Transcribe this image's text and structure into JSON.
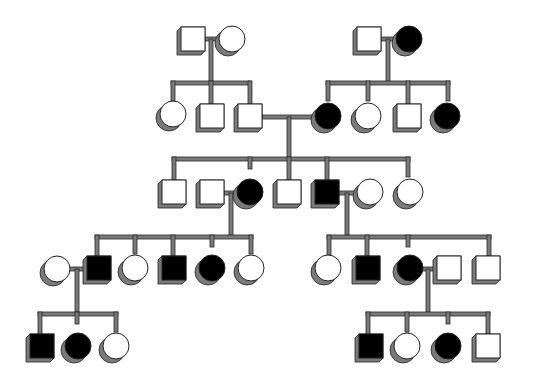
{
  "diagram": {
    "type": "pedigree",
    "legend_note": "Square = male, circle = female, filled = affected",
    "colors": {
      "affected": "#000000",
      "unaffected": "#ffffff",
      "outline": "#222222",
      "shadow": "#7a7a7a",
      "line": "#7a7a7a"
    },
    "generations": [
      {
        "label": "I",
        "individuals": [
          {
            "id": "I-1",
            "sex": "male",
            "affected": false
          },
          {
            "id": "I-2",
            "sex": "female",
            "affected": false
          },
          {
            "id": "I-3",
            "sex": "male",
            "affected": false
          },
          {
            "id": "I-4",
            "sex": "female",
            "affected": true
          }
        ]
      },
      {
        "label": "II",
        "individuals": [
          {
            "id": "II-1",
            "sex": "female",
            "affected": false
          },
          {
            "id": "II-2",
            "sex": "male",
            "affected": false
          },
          {
            "id": "II-3",
            "sex": "male",
            "affected": false
          },
          {
            "id": "II-4",
            "sex": "female",
            "affected": true
          },
          {
            "id": "II-5",
            "sex": "female",
            "affected": false
          },
          {
            "id": "II-6",
            "sex": "male",
            "affected": false
          },
          {
            "id": "II-7",
            "sex": "female",
            "affected": true
          }
        ]
      },
      {
        "label": "III",
        "individuals": [
          {
            "id": "III-1",
            "sex": "male",
            "affected": false
          },
          {
            "id": "III-2",
            "sex": "male",
            "affected": false
          },
          {
            "id": "III-3",
            "sex": "female",
            "affected": true
          },
          {
            "id": "III-4",
            "sex": "male",
            "affected": false
          },
          {
            "id": "III-5",
            "sex": "male",
            "affected": true
          },
          {
            "id": "III-6",
            "sex": "female",
            "affected": false
          },
          {
            "id": "III-7",
            "sex": "female",
            "affected": false
          }
        ]
      },
      {
        "label": "IV",
        "individuals": [
          {
            "id": "IV-1",
            "sex": "female",
            "affected": false
          },
          {
            "id": "IV-2",
            "sex": "male",
            "affected": true
          },
          {
            "id": "IV-3",
            "sex": "female",
            "affected": false
          },
          {
            "id": "IV-4",
            "sex": "male",
            "affected": true
          },
          {
            "id": "IV-5",
            "sex": "female",
            "affected": true
          },
          {
            "id": "IV-6",
            "sex": "female",
            "affected": false
          },
          {
            "id": "IV-7",
            "sex": "female",
            "affected": false
          },
          {
            "id": "IV-8",
            "sex": "male",
            "affected": true
          },
          {
            "id": "IV-9",
            "sex": "female",
            "affected": true
          },
          {
            "id": "IV-10",
            "sex": "male",
            "affected": false
          },
          {
            "id": "IV-11",
            "sex": "male",
            "affected": false
          }
        ]
      },
      {
        "label": "V",
        "individuals": [
          {
            "id": "V-1",
            "sex": "male",
            "affected": true
          },
          {
            "id": "V-2",
            "sex": "female",
            "affected": true
          },
          {
            "id": "V-3",
            "sex": "female",
            "affected": false
          },
          {
            "id": "V-4",
            "sex": "male",
            "affected": true
          },
          {
            "id": "V-5",
            "sex": "female",
            "affected": false
          },
          {
            "id": "V-6",
            "sex": "female",
            "affected": true
          },
          {
            "id": "V-7",
            "sex": "male",
            "affected": false
          }
        ]
      }
    ],
    "matings": [
      {
        "partners": [
          "I-1",
          "I-2"
        ],
        "children": [
          "II-1",
          "II-2",
          "II-3"
        ]
      },
      {
        "partners": [
          "I-3",
          "I-4"
        ],
        "children": [
          "II-4",
          "II-5",
          "II-6",
          "II-7"
        ]
      },
      {
        "partners": [
          "II-3",
          "II-4"
        ],
        "children": [
          "III-1",
          "III-3",
          "III-4",
          "III-5",
          "III-7"
        ]
      },
      {
        "partners": [
          "III-2",
          "III-3"
        ],
        "children": [
          "IV-2",
          "IV-3",
          "IV-4",
          "IV-5",
          "IV-6"
        ]
      },
      {
        "partners": [
          "III-5",
          "III-6"
        ],
        "children": [
          "IV-7",
          "IV-8",
          "IV-9",
          "IV-11"
        ]
      },
      {
        "partners": [
          "IV-1",
          "IV-2"
        ],
        "children": [
          "V-1",
          "V-2",
          "V-3"
        ]
      },
      {
        "partners": [
          "IV-9",
          "IV-10"
        ],
        "children": [
          "V-4",
          "V-5",
          "V-6",
          "V-7"
        ]
      }
    ]
  }
}
